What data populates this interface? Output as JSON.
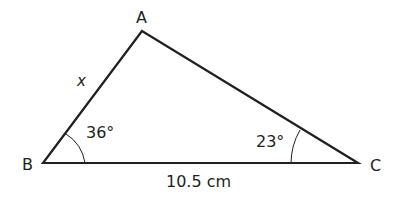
{
  "diagram": {
    "type": "triangle",
    "vertices": {
      "A": {
        "label": "A",
        "x": 142,
        "y": 31
      },
      "B": {
        "label": "B",
        "x": 43,
        "y": 163
      },
      "C": {
        "label": "C",
        "x": 358,
        "y": 163
      }
    },
    "angles": {
      "B": "36°",
      "C": "23°"
    },
    "sides": {
      "AB": "x",
      "BC": "10.5 cm"
    },
    "stroke_color": "#231f20"
  }
}
